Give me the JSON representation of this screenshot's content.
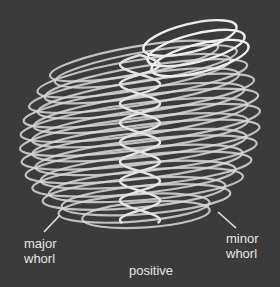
{
  "diagram": {
    "background_color": "#3b3b3b",
    "line_color": "#dcdcdc",
    "labels": {
      "major": [
        "major",
        "whorl"
      ],
      "minor": [
        "minor",
        "whorl"
      ],
      "caption": "positive"
    }
  }
}
